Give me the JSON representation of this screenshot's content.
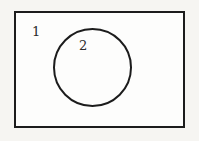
{
  "diagram": {
    "type": "euler-set-diagram",
    "outer_set": {
      "label": "1",
      "shape": "rectangle"
    },
    "inner_set": {
      "label": "2",
      "shape": "circle"
    },
    "colors": {
      "border": "#1c1c1c",
      "fill": "#fdfdfc",
      "background": "#f6f5f2",
      "label_text": "#2a2a2a"
    }
  }
}
